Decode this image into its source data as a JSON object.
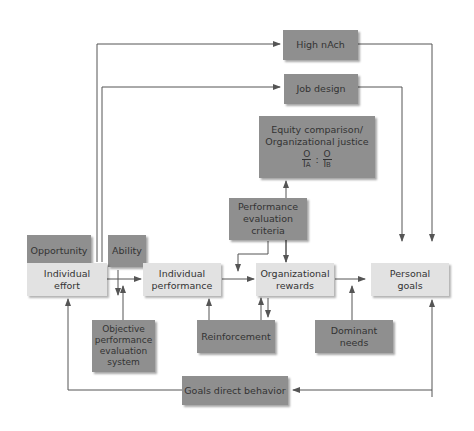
{
  "diagram": {
    "nodes": {
      "high_nach": "High nAch",
      "job_design": "Job design",
      "equity_line1": "Equity comparison/",
      "equity_line2": "Organizational justice",
      "equity_o_a": "O",
      "equity_i_a": "I",
      "equity_sub_a": "A",
      "equity_colon": ":",
      "equity_o_b": "O",
      "equity_i_b": "I",
      "equity_sub_b": "B",
      "opportunity": "Opportunity",
      "ability": "Ability",
      "perf_criteria": "Performance evaluation criteria",
      "individual_effort": "Individual effort",
      "individual_performance": "Individual performance",
      "organizational_rewards": "Organizational rewards",
      "personal_goals": "Personal goals",
      "objective_perf_eval": "Objective performance evaluation system",
      "reinforcement": "Reinforcement",
      "dominant_needs": "Dominant needs",
      "goals_direct_behavior": "Goals direct behavior"
    },
    "colors": {
      "dark_box": "#8f8f8f",
      "light_box": "#e2e2e2",
      "line": "#555555"
    }
  }
}
